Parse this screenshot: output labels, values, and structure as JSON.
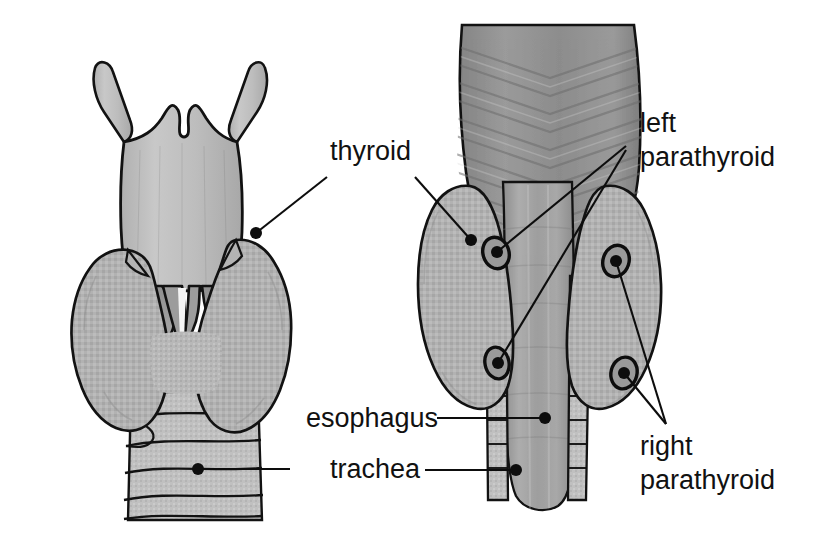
{
  "figure": {
    "background_color": "#ffffff",
    "ink_color": "#111111",
    "views": [
      {
        "name": "anterior-view",
        "position": "left",
        "structures": [
          "thyroid cartilage",
          "superior horns",
          "cricothyroid muscle",
          "thyroid gland lobes",
          "isthmus",
          "trachea"
        ]
      },
      {
        "name": "posterior-view",
        "position": "right",
        "structures": [
          "inferior pharyngeal constrictor muscle",
          "thyroid gland lobes",
          "superior parathyroid glands",
          "inferior parathyroid glands",
          "esophagus",
          "trachea"
        ]
      }
    ],
    "palette": {
      "gland_fill": "#b0b0b0",
      "gland_fill_light": "#c2c2c2",
      "cartilage_fill": "#bdbdbd",
      "muscle_fill": "#8f8f8f",
      "muscle_dark": "#7b7b7b",
      "esophagus_fill": "#9a9a9a",
      "outline": "#121212",
      "parathyroid_fill": "#8a8a8a"
    }
  },
  "labels": {
    "thyroid": {
      "text": "thyroid",
      "x": 330,
      "y": 160,
      "anchors": [
        {
          "target": "left-figure-thyroid-lobe",
          "x": 256,
          "y": 233
        },
        {
          "target": "right-figure-thyroid-lobe",
          "x": 471,
          "y": 240
        }
      ]
    },
    "left_parathyroid": {
      "line1": "left",
      "line2": "parathyroid",
      "x": 640,
      "y1": 132,
      "y2": 166,
      "converge": {
        "x": 626,
        "y": 146
      },
      "anchors": [
        {
          "target": "left-superior-parathyroid",
          "x": 497,
          "y": 252
        },
        {
          "target": "left-inferior-parathyroid",
          "x": 498,
          "y": 363
        }
      ]
    },
    "right_parathyroid": {
      "line1": "right",
      "line2": "parathyroid",
      "x": 640,
      "y1": 455,
      "y2": 489,
      "converge": {
        "x": 666,
        "y": 424
      },
      "anchors": [
        {
          "target": "right-superior-parathyroid",
          "x": 616,
          "y": 261
        },
        {
          "target": "right-inferior-parathyroid",
          "x": 624,
          "y": 373
        }
      ]
    },
    "esophagus": {
      "text": "esophagus",
      "x": 306,
      "y": 424,
      "anchors": [
        {
          "target": "esophagus-tube",
          "x": 545,
          "y": 418
        }
      ]
    },
    "trachea": {
      "text": "trachea",
      "x": 330,
      "y": 478,
      "anchors": [
        {
          "target": "left-figure-trachea",
          "x": 198,
          "y": 469
        },
        {
          "target": "right-figure-trachea",
          "x": 516,
          "y": 470
        }
      ]
    }
  }
}
